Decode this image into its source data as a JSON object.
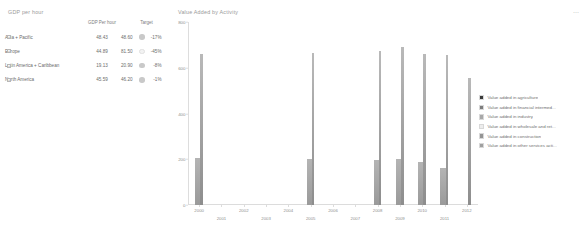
{
  "gdp_panel": {
    "title": "GDP per hour",
    "columns": [
      "",
      "GDP Per hour",
      "Target"
    ],
    "rows": [
      {
        "region": "Asia + Pacific",
        "gdp": "48.43",
        "target": "48.60",
        "variance": "-17%",
        "kpi": "grey"
      },
      {
        "region": "Europe",
        "gdp": "44.89",
        "target": "81.50",
        "variance": "-45%",
        "kpi": "light"
      },
      {
        "region": "Latin America + Caribbean",
        "gdp": "19.13",
        "target": "20.90",
        "variance": "-8%",
        "kpi": "grey"
      },
      {
        "region": "North America",
        "gdp": "45.59",
        "target": "46.20",
        "variance": "-1%",
        "kpi": "grey"
      }
    ],
    "expander_glyph": "+"
  },
  "chart_panel": {
    "title": "Value Added by Activity",
    "menu_icon": "⋯"
  },
  "chart_data": {
    "type": "bar",
    "title": "Value Added by Activity",
    "xlabel": "",
    "ylabel": "",
    "ylim": [
      0,
      800
    ],
    "y_ticks": [
      0,
      200,
      400,
      600,
      800
    ],
    "y_tick_labels": [
      "0",
      "200",
      "400",
      "600",
      "800"
    ],
    "grid": false,
    "legend_position": "right",
    "categories": [
      "2000",
      "2001",
      "2002",
      "2003",
      "2004",
      "2005",
      "2006",
      "2007",
      "2008",
      "2009",
      "2010",
      "2011",
      "2012"
    ],
    "series": [
      {
        "name": "Value added in agriculture",
        "color": "#3a3a3a",
        "values": [
          null,
          null,
          null,
          null,
          null,
          null,
          null,
          null,
          null,
          null,
          null,
          null,
          null
        ]
      },
      {
        "name": "Value added in financial intermed...",
        "color": "#7d7d7d",
        "values": [
          null,
          null,
          null,
          null,
          null,
          null,
          null,
          null,
          null,
          null,
          null,
          null,
          null
        ]
      },
      {
        "name": "Value added in industry",
        "color": "#a8a8a8",
        "values": [
          205,
          null,
          null,
          null,
          null,
          200,
          null,
          null,
          196,
          200,
          190,
          160,
          null
        ]
      },
      {
        "name": "Value added in wholesale and ret...",
        "color": "#ededed",
        "values": [
          null,
          null,
          null,
          null,
          null,
          null,
          null,
          null,
          null,
          null,
          null,
          null,
          null
        ]
      },
      {
        "name": "Value added in construction",
        "color": "#949494",
        "values": [
          null,
          null,
          null,
          null,
          null,
          null,
          null,
          null,
          null,
          null,
          null,
          null,
          null
        ]
      },
      {
        "name": "Value added in other services acti...",
        "color": "#a0a0a0",
        "values": [
          660,
          null,
          null,
          null,
          null,
          665,
          null,
          null,
          672,
          690,
          660,
          655,
          555
        ]
      }
    ]
  }
}
